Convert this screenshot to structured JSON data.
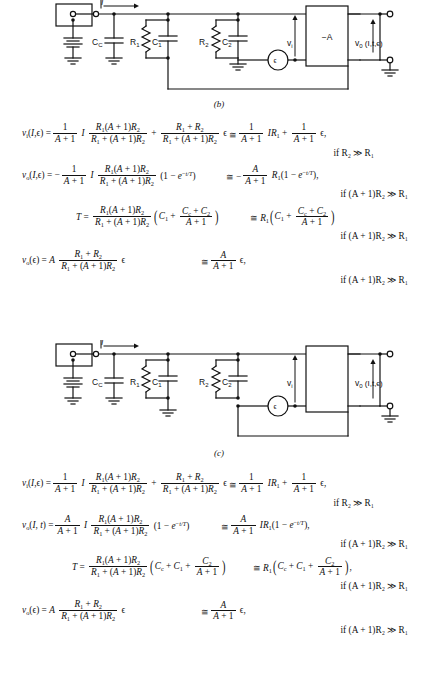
{
  "figures": [
    {
      "id": "fig-b",
      "caption": "(b)",
      "labels": {
        "current": "I",
        "coupling_cap": "C",
        "coupling_cap_sub": "C",
        "r1": "R",
        "r1_sub": "1",
        "c1": "C",
        "c1_sub": "1",
        "r2": "R",
        "r2_sub": "2",
        "c2": "C",
        "c2_sub": "2",
        "vi": "v",
        "vi_sub": "i",
        "amp": "−A",
        "vo": "v",
        "vo_sub": "0",
        "vo_args": "(I, t, ϵ)",
        "noise_source": "ϵ"
      },
      "amp_labeled": true
    },
    {
      "id": "fig-c",
      "caption": "(c)",
      "labels": {
        "current": "I",
        "coupling_cap": "C",
        "coupling_cap_sub": "C",
        "r1": "R",
        "r1_sub": "1",
        "c1": "C",
        "c1_sub": "1",
        "r2": "R",
        "r2_sub": "2",
        "c2": "C",
        "c2_sub": "2",
        "vi": "v",
        "vi_sub": "i",
        "amp": "",
        "vo": "v",
        "vo_sub": "0",
        "vo_args": "(I, t, ϵ)",
        "noise_source": "ϵ"
      },
      "amp_labeled": false
    }
  ],
  "equations_b": {
    "eq1": {
      "lhs": "v_i(I, ϵ) =",
      "term1_coef_num": "1",
      "term1_coef_den": "A + 1",
      "term1_I": "I",
      "term1_num": "R₁(A + 1)R₂",
      "term1_den": "R₁ + (A + 1)R₂",
      "plus": "+",
      "term2_num": "R₁ + R₂",
      "term2_den": "R₁ + (A + 1)R₂",
      "eps": "ϵ",
      "approx": "≅",
      "rhs_num": "1",
      "rhs_den": "A + 1",
      "rhs_IR": "IR₁",
      "rhs_plus": "+",
      "rhs2_num": "1",
      "rhs2_den": "A + 1",
      "rhs2_eps": "ϵ,",
      "condition": "if   R₂ ≫ R₁"
    },
    "eq2": {
      "lhs": "v_o(I, ϵ) = −",
      "coef_num": "1",
      "coef_den": "A + 1",
      "I": "I",
      "num": "R₁(A + 1)R₂",
      "den": "R₁ + (A + 1)R₂",
      "tail": "(1 − e⁻ᵗᵠᵀ)",
      "approx": "≅ −",
      "rhs_num": "A",
      "rhs_den": "A + 1",
      "rhs_tail": "R₁(1 − e⁻ᵗᵠᵀ),",
      "condition": "if   (A + 1)R₂ ≫ R₁"
    },
    "eq3": {
      "lhs": "T =",
      "num": "R₁(A + 1)R₂",
      "den": "R₁ + (A + 1)R₂",
      "paren_first": "C₁ +",
      "inner_num": "Cᴄ + C₂",
      "inner_den": "A + 1",
      "approx": "≅",
      "rhs_lead": "R₁",
      "rhs_paren_first": "C₁ +",
      "rhs_inner_num": "Cᴄ + C₂",
      "rhs_inner_den": "A + 1",
      "condition": "if   (A + 1)R₂ ≫ R₁"
    },
    "eq4": {
      "lhs": "v_o(ϵ) = A",
      "num": "R₁ + R₂",
      "den": "R₁ + (A + 1)R₂",
      "eps": "ϵ",
      "approx": "≅",
      "rhs_num": "A",
      "rhs_den": "A + 1",
      "rhs_eps": "ϵ,",
      "condition": "if   (A + 1)R₂ ≫ R₁"
    }
  },
  "equations_c": {
    "eq1": {
      "lhs": "v_i(I, ϵ) =",
      "term1_coef_num": "1",
      "term1_coef_den": "A + 1",
      "term1_I": "I",
      "term1_num": "R₁(A + 1)R₂",
      "term1_den": "R₁ + (A + 1)R₂",
      "plus": "+",
      "term2_num": "R₁ + R₂",
      "term2_den": "R₁ + (A + 1)R₂",
      "eps": "ϵ",
      "approx": "≅",
      "rhs_num": "1",
      "rhs_den": "A + 1",
      "rhs_IR": "IR₁",
      "rhs_plus": "+",
      "rhs2_num": "1",
      "rhs2_den": "A + 1",
      "rhs2_eps": "ϵ,",
      "condition": "if   R₂ ≫ R₁"
    },
    "eq2": {
      "lhs": "v_o(I, t) =",
      "coef_num": "A",
      "coef_den": "A + 1",
      "I": "I",
      "num": "R₁(A + 1)R₂",
      "den": "R₁ + (A + 1)R₂",
      "tail": "(1 − e⁻ᵗᵠᵀ)",
      "approx": "≅",
      "rhs_num": "A",
      "rhs_den": "A + 1",
      "rhs_tail": "IR₁(1 − e⁻ᵗᵠᵀ),",
      "condition": "if   (A + 1)R₂ ≫ R₁"
    },
    "eq3": {
      "lhs": "T =",
      "num": "R₁(A + 1)R₂",
      "den": "R₁ + (A + 1)R₂",
      "paren_first": "Cᴄ + C₁ +",
      "inner_num": "C₂",
      "inner_den": "A + 1",
      "approx": "≅",
      "rhs_lead": "R₁",
      "rhs_paren_first": "Cᴄ + C₁ +",
      "rhs_inner_num": "C₂",
      "rhs_inner_den": "A + 1",
      "condition": "if   (A + 1)R₂ ≫ R₁"
    },
    "eq4": {
      "lhs": "v_o(ϵ) = A",
      "num": "R₁ + R₂",
      "den": "R₁ + (A + 1)R₂",
      "eps": "ϵ",
      "approx": "≅",
      "rhs_num": "A",
      "rhs_den": "A + 1",
      "rhs_eps": "ϵ,",
      "condition": "if   (A + 1)R₂ ≫ R₁"
    }
  }
}
